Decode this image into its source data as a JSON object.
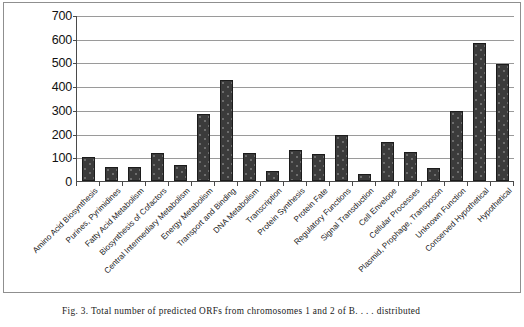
{
  "figure": {
    "caption": "Fig. 3. Total number of predicted ORFs from chromosomes 1 and 2 of B. . . . distributed"
  },
  "chart_data": {
    "type": "bar",
    "title": "",
    "xlabel": "",
    "ylabel": "",
    "ylim": [
      0,
      700
    ],
    "ytick_step": 100,
    "yticks": [
      700,
      600,
      500,
      400,
      300,
      200,
      100,
      0
    ],
    "grid": true,
    "legend": "none",
    "bar_color": "#3b3b3b",
    "bar_edge_color": "#1c1c1c",
    "gridline_color": "#9a9a9a",
    "axis_color": "#4a4a4a",
    "categories": [
      "Amino Acid Biosynthesis",
      "Purines, Pyrimidines",
      "Fatty Acid Metabolism",
      "Biosynthesis of Cofactors",
      "Central Intermediary Metabolism",
      "Energy Metabolism",
      "Transport and Binding",
      "DNA Metabolism",
      "Transcription",
      "Protein Synthesis",
      "Protein Fate",
      "Regulatory Functions",
      "Signal Transduction",
      "Cell Envelope",
      "Cellular Processes",
      "Plasmid, Prophage, Transposon",
      "Unknown Function",
      "Conserved Hypothetical",
      "Hypothetical"
    ],
    "values": [
      100,
      58,
      58,
      117,
      68,
      282,
      428,
      117,
      42,
      130,
      115,
      192,
      28,
      165,
      122,
      55,
      295,
      580,
      492
    ]
  }
}
